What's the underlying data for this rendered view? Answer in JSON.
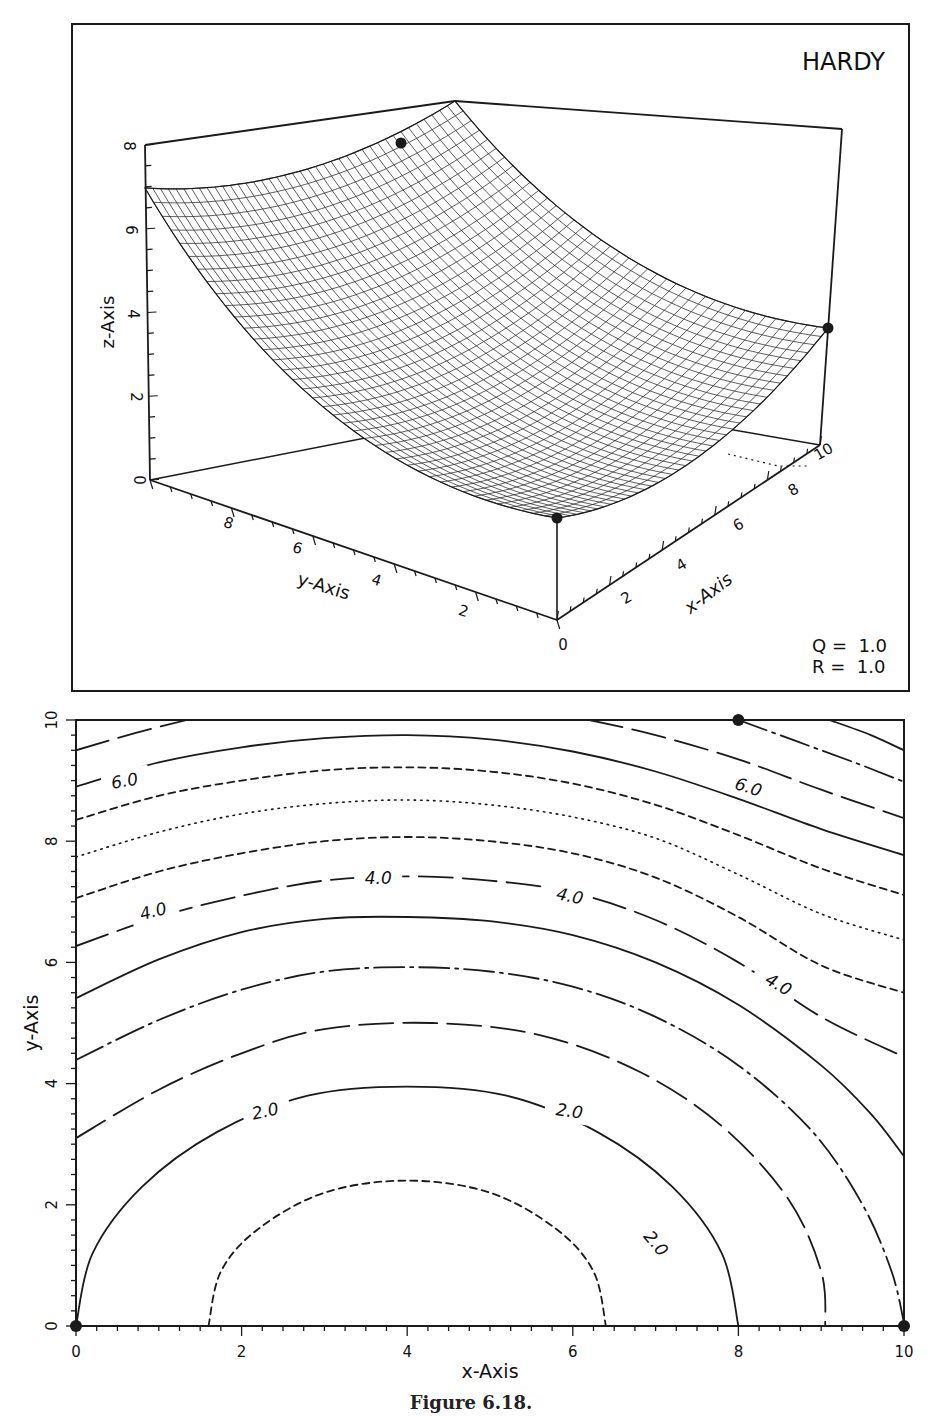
{
  "caption": "Figure 6.18.",
  "colors": {
    "ink": "#1a1a1a",
    "paper": "#ffffff"
  },
  "chart_data": [
    {
      "type": "surface3d",
      "title": "HARDY",
      "xlabel": "x-Axis",
      "ylabel": "y-Axis",
      "zlabel": "z-Axis",
      "xticks": [
        0,
        2,
        4,
        6,
        8,
        10
      ],
      "yticks": [
        2,
        4,
        6,
        8
      ],
      "zticks": [
        0,
        2,
        4,
        6,
        8
      ],
      "xlim": [
        0,
        10
      ],
      "ylim": [
        0,
        10
      ],
      "zlim": [
        0,
        8
      ],
      "annotations": [
        "Q =  1.0",
        "R =  1.0"
      ],
      "data_points": [
        {
          "x": 0,
          "y": 0,
          "z": 2.0
        },
        {
          "x": 10,
          "y": 0,
          "z": 3.0
        },
        {
          "x": 8,
          "y": 10,
          "z": 8.0
        },
        {
          "x": 0,
          "y": 10,
          "z": 7.0
        }
      ],
      "mesh": {
        "nx": 40,
        "ny": 40
      },
      "grid": false
    },
    {
      "type": "contour",
      "xlabel": "x-Axis",
      "ylabel": "y-Axis",
      "xticks": [
        0,
        2,
        4,
        6,
        8,
        10
      ],
      "yticks": [
        0,
        2,
        4,
        6,
        8,
        10
      ],
      "xlim": [
        0,
        10
      ],
      "ylim": [
        0,
        10
      ],
      "levels": [
        1.5,
        2.0,
        2.5,
        3.0,
        3.5,
        4.0,
        4.5,
        5.0,
        5.5,
        6.0,
        6.5,
        7.0,
        7.5
      ],
      "level_labels": [
        {
          "text": "2.0",
          "x": 2.3,
          "y": 3.55,
          "rot": -12
        },
        {
          "text": "2.0",
          "x": 5.95,
          "y": 3.55,
          "rot": 8
        },
        {
          "text": "2.0",
          "x": 6.95,
          "y": 1.4,
          "rot": 50
        },
        {
          "text": "4.0",
          "x": 0.95,
          "y": 6.85,
          "rot": -14
        },
        {
          "text": "4.0",
          "x": 3.65,
          "y": 7.4,
          "rot": 0
        },
        {
          "text": "4.0",
          "x": 5.95,
          "y": 7.1,
          "rot": 12
        },
        {
          "text": "4.0",
          "x": 8.45,
          "y": 5.65,
          "rot": 30
        },
        {
          "text": "6.0",
          "x": 0.6,
          "y": 9.0,
          "rot": -10
        },
        {
          "text": "6.0",
          "x": 8.1,
          "y": 8.9,
          "rot": 18
        }
      ],
      "contours": [
        {
          "level": 1.5,
          "style": "dashed",
          "points": [
            [
              1.6,
              0
            ],
            [
              1.75,
              0.9
            ],
            [
              2.2,
              1.6
            ],
            [
              3.0,
              2.2
            ],
            [
              4.0,
              2.4
            ],
            [
              5.0,
              2.2
            ],
            [
              5.8,
              1.6
            ],
            [
              6.25,
              0.9
            ],
            [
              6.4,
              0
            ]
          ]
        },
        {
          "level": 2.0,
          "style": "solid",
          "points": [
            [
              0,
              0
            ],
            [
              0.2,
              1.2
            ],
            [
              0.8,
              2.3
            ],
            [
              1.7,
              3.2
            ],
            [
              2.8,
              3.8
            ],
            [
              4.0,
              3.95
            ],
            [
              5.2,
              3.8
            ],
            [
              6.3,
              3.2
            ],
            [
              7.2,
              2.3
            ],
            [
              7.8,
              1.2
            ],
            [
              8.0,
              0
            ]
          ]
        },
        {
          "level": 2.5,
          "style": "longdash",
          "points": [
            [
              0,
              3.1
            ],
            [
              1.0,
              3.9
            ],
            [
              2.0,
              4.5
            ],
            [
              3.0,
              4.9
            ],
            [
              4.3,
              5.0
            ],
            [
              5.6,
              4.8
            ],
            [
              6.8,
              4.2
            ],
            [
              7.8,
              3.3
            ],
            [
              8.6,
              2.1
            ],
            [
              9.0,
              0.9
            ],
            [
              9.05,
              0
            ]
          ]
        },
        {
          "level": 3.0,
          "style": "dashdot",
          "points": [
            [
              0,
              4.39
            ],
            [
              1.0,
              5.05
            ],
            [
              2.0,
              5.55
            ],
            [
              3.0,
              5.85
            ],
            [
              4.0,
              5.92
            ],
            [
              5.0,
              5.85
            ],
            [
              6.0,
              5.6
            ],
            [
              7.0,
              5.1
            ],
            [
              8.0,
              4.3
            ],
            [
              8.9,
              3.2
            ],
            [
              9.5,
              2.0
            ],
            [
              9.85,
              0.9
            ],
            [
              10,
              0.05
            ]
          ]
        },
        {
          "level": 3.5,
          "style": "solid",
          "points": [
            [
              0,
              5.41
            ],
            [
              1.0,
              6.05
            ],
            [
              2.0,
              6.5
            ],
            [
              3.0,
              6.72
            ],
            [
              4.0,
              6.75
            ],
            [
              5.0,
              6.68
            ],
            [
              6.0,
              6.45
            ],
            [
              7.0,
              6.0
            ],
            [
              8.0,
              5.3
            ],
            [
              9.0,
              4.3
            ],
            [
              9.6,
              3.5
            ],
            [
              10,
              2.8
            ]
          ]
        },
        {
          "level": 4.0,
          "style": "longdash",
          "points": [
            [
              0,
              6.27
            ],
            [
              1.0,
              6.75
            ],
            [
              2.0,
              7.1
            ],
            [
              3.0,
              7.35
            ],
            [
              4.0,
              7.42
            ],
            [
              5.0,
              7.35
            ],
            [
              6.0,
              7.15
            ],
            [
              7.0,
              6.7
            ],
            [
              8.0,
              6.0
            ],
            [
              9.0,
              5.1
            ],
            [
              10,
              4.44
            ]
          ]
        },
        {
          "level": 4.5,
          "style": "dashed",
          "points": [
            [
              0,
              7.06
            ],
            [
              1.0,
              7.5
            ],
            [
              2.0,
              7.8
            ],
            [
              3.0,
              8.0
            ],
            [
              4.0,
              8.07
            ],
            [
              5.0,
              8.0
            ],
            [
              6.0,
              7.8
            ],
            [
              7.0,
              7.4
            ],
            [
              8.0,
              6.75
            ],
            [
              9.0,
              5.95
            ],
            [
              10,
              5.5
            ]
          ]
        },
        {
          "level": 5.0,
          "style": "dotted",
          "points": [
            [
              0,
              7.74
            ],
            [
              1.0,
              8.15
            ],
            [
              2.0,
              8.45
            ],
            [
              3.0,
              8.62
            ],
            [
              4.0,
              8.68
            ],
            [
              5.0,
              8.6
            ],
            [
              6.0,
              8.4
            ],
            [
              7.0,
              8.05
            ],
            [
              8.0,
              7.45
            ],
            [
              9.0,
              6.8
            ],
            [
              10,
              6.37
            ]
          ]
        },
        {
          "level": 5.5,
          "style": "dashed",
          "points": [
            [
              0,
              8.35
            ],
            [
              1.0,
              8.75
            ],
            [
              2.0,
              9.0
            ],
            [
              3.0,
              9.17
            ],
            [
              4.0,
              9.22
            ],
            [
              5.0,
              9.15
            ],
            [
              6.0,
              8.95
            ],
            [
              7.0,
              8.6
            ],
            [
              8.0,
              8.1
            ],
            [
              9.0,
              7.55
            ],
            [
              10,
              7.11
            ]
          ]
        },
        {
          "level": 6.0,
          "style": "solid",
          "points": [
            [
              0,
              8.9
            ],
            [
              1.0,
              9.3
            ],
            [
              2.0,
              9.55
            ],
            [
              3.0,
              9.7
            ],
            [
              4.0,
              9.75
            ],
            [
              5.0,
              9.68
            ],
            [
              6.0,
              9.48
            ],
            [
              7.0,
              9.15
            ],
            [
              8.0,
              8.7
            ],
            [
              9.0,
              8.2
            ],
            [
              10,
              7.77
            ]
          ]
        },
        {
          "level": 6.5,
          "style": "longdash",
          "points": [
            [
              0,
              9.5
            ],
            [
              0.7,
              9.78
            ],
            [
              1.34,
              10
            ]
          ]
        },
        {
          "level": 6.5,
          "style": "longdash",
          "points": [
            [
              6.2,
              10
            ],
            [
              7.0,
              9.75
            ],
            [
              8.0,
              9.35
            ],
            [
              9.0,
              8.85
            ],
            [
              10,
              8.38
            ]
          ]
        },
        {
          "level": 7.0,
          "style": "dashdot",
          "points": [
            [
              8.0,
              10
            ],
            [
              8.7,
              9.65
            ],
            [
              9.4,
              9.3
            ],
            [
              10,
              8.98
            ]
          ]
        },
        {
          "level": 7.5,
          "style": "solid",
          "points": [
            [
              9.1,
              10
            ],
            [
              9.6,
              9.75
            ],
            [
              10,
              9.5
            ]
          ]
        }
      ],
      "data_points": [
        {
          "x": 0,
          "y": 0
        },
        {
          "x": 10,
          "y": 0
        },
        {
          "x": 8,
          "y": 10
        }
      ]
    }
  ],
  "labels": {
    "top_title": "HARDY",
    "q_label": "Q =  1.0",
    "r_label": "R =  1.0",
    "z_axis": "z-Axis",
    "y_axis_3d": "y-Axis",
    "x_axis_3d": "x-Axis",
    "x_axis_2d": "x-Axis",
    "y_axis_2d": "y-Axis"
  }
}
